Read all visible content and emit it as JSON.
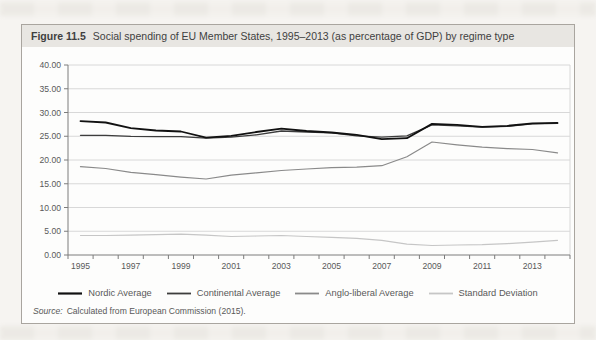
{
  "figure": {
    "label": "Figure 11.5",
    "title": "Social spending of EU Member States, 1995–2013 (as percentage of GDP) by regime type",
    "source_label": "Source:",
    "source_text": "Calculated from European Commission (2015)."
  },
  "colors": {
    "gridline": "#d8d8d8",
    "axis": "#7c7c7c",
    "text": "#595959",
    "header_bg": "#e8e6e2",
    "box_border": "#a9a59f"
  },
  "chart_data": {
    "type": "line",
    "title": "",
    "xlabel": "",
    "ylabel": "",
    "ylim": [
      0,
      40
    ],
    "grid": "horizontal",
    "legend_position": "bottom",
    "x": [
      1995,
      1996,
      1997,
      1998,
      1999,
      2000,
      2001,
      2002,
      2003,
      2004,
      2005,
      2006,
      2007,
      2008,
      2009,
      2010,
      2011,
      2012,
      2013,
      2014
    ],
    "x_tick_labels": [
      "1995",
      "1997",
      "1999",
      "2001",
      "2003",
      "2005",
      "2007",
      "2009",
      "2011",
      "2013"
    ],
    "y_tick_values": [
      0,
      5,
      10,
      15,
      20,
      25,
      30,
      35,
      40
    ],
    "y_tick_labels": [
      "0.00",
      "5.00",
      "10.00",
      "15.00",
      "20.00",
      "25.00",
      "30.00",
      "35.00",
      "40.00"
    ],
    "series": [
      {
        "name": "Nordic Average",
        "color": "#111111",
        "width": 1.8,
        "values": [
          28.2,
          27.9,
          26.7,
          26.2,
          26.0,
          24.7,
          25.1,
          25.9,
          26.6,
          26.1,
          25.8,
          25.3,
          24.4,
          24.6,
          27.6,
          27.4,
          27.0,
          27.2,
          27.7,
          27.8
        ]
      },
      {
        "name": "Continental Average",
        "color": "#3d3d3d",
        "width": 1.3,
        "values": [
          25.2,
          25.2,
          25.0,
          24.9,
          24.9,
          24.6,
          24.8,
          25.3,
          26.1,
          25.9,
          25.7,
          25.1,
          24.8,
          25.1,
          27.4,
          27.2,
          26.9,
          27.1,
          27.6,
          27.7
        ]
      },
      {
        "name": "Anglo-liberal Average",
        "color": "#8a8a8a",
        "width": 1.2,
        "values": [
          18.6,
          18.2,
          17.4,
          16.9,
          16.4,
          16.0,
          16.8,
          17.3,
          17.8,
          18.1,
          18.4,
          18.5,
          18.8,
          20.7,
          23.8,
          23.2,
          22.7,
          22.4,
          22.2,
          21.5
        ]
      },
      {
        "name": "Standard Deviation",
        "color": "#c6c6c6",
        "width": 1.2,
        "values": [
          4.1,
          4.1,
          4.2,
          4.3,
          4.4,
          4.2,
          3.9,
          4.0,
          4.1,
          3.9,
          3.7,
          3.5,
          3.1,
          2.3,
          2.0,
          2.1,
          2.2,
          2.4,
          2.7,
          3.1
        ]
      }
    ]
  }
}
